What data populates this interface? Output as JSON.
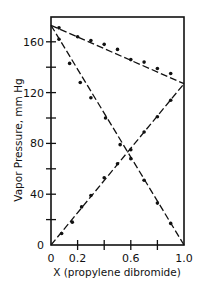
{
  "chart_data": {
    "type": "line",
    "title": "",
    "xlabel": "X (propylene dibromide)",
    "ylabel": "Vapor Pressure, mm Hg",
    "xlim": [
      0,
      1.0
    ],
    "ylim": [
      0,
      180
    ],
    "x_ticks": [
      0,
      0.1,
      0.2,
      0.3,
      0.4,
      0.5,
      0.6,
      0.7,
      0.8,
      0.9,
      1.0
    ],
    "x_tick_labels": [
      "0",
      "",
      "0.2",
      "",
      "",
      "",
      "0.6",
      "",
      "",
      "",
      "1.0"
    ],
    "x_tick_labels_visible": [
      {
        "v": 0,
        "label": "0"
      },
      {
        "v": 0.2,
        "label": "0.2"
      },
      {
        "v": 0.6,
        "label": "0.6"
      },
      {
        "v": 1.0,
        "label": "1.0"
      }
    ],
    "x_minor_ticks": [
      0.2,
      0.4,
      0.6,
      0.8
    ],
    "y_ticks": [
      0,
      20,
      40,
      60,
      80,
      100,
      120,
      140,
      160
    ],
    "y_tick_labels_visible": [
      {
        "v": 0,
        "label": "0"
      },
      {
        "v": 40,
        "label": "40"
      },
      {
        "v": 80,
        "label": "80"
      },
      {
        "v": 120,
        "label": "120"
      },
      {
        "v": 160,
        "label": "160"
      }
    ],
    "grid": false,
    "legend": null,
    "series": [
      {
        "name": "Total vapor pressure",
        "style": "dash-dot",
        "x": [
          0,
          0.06,
          0.2,
          0.3,
          0.4,
          0.5,
          0.6,
          0.7,
          0.8,
          0.9,
          1.0
        ],
        "values": [
          173,
          171,
          164,
          161,
          158,
          154,
          146,
          144,
          139,
          135,
          127
        ]
      },
      {
        "name": "Propylene dibromide partial pressure",
        "style": "dash-dot",
        "x": [
          0,
          0.08,
          0.16,
          0.23,
          0.3,
          0.4,
          0.5,
          0.6,
          0.7,
          0.8,
          0.9,
          1.0
        ],
        "values": [
          0,
          9,
          18,
          30,
          39,
          53,
          64,
          75,
          89,
          101,
          114,
          127
        ]
      },
      {
        "name": "Ethylene dibromide partial pressure",
        "style": "dash-dot",
        "x": [
          0,
          0.06,
          0.14,
          0.22,
          0.3,
          0.41,
          0.52,
          0.6,
          0.7,
          0.8,
          0.9,
          1.0
        ],
        "values": [
          173,
          162,
          143,
          128,
          116,
          100,
          79,
          68,
          51,
          33,
          17,
          0
        ]
      }
    ]
  },
  "axes": {
    "x_label": "X (propylene dibromide)",
    "y_label": "Vapor Pressure, mm Hg"
  }
}
